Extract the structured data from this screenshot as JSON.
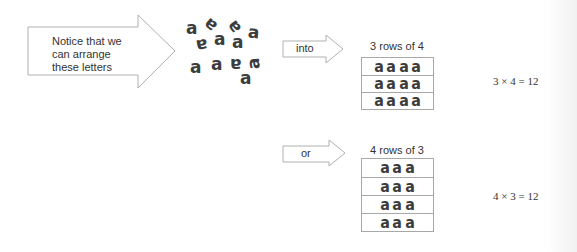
{
  "intro_arrow": {
    "lines": [
      "Notice that we",
      "can arrange",
      "these letters"
    ]
  },
  "scattered_letters": [
    {
      "char": "a",
      "x": 186,
      "y": 20,
      "rot": 0
    },
    {
      "char": "a",
      "x": 205,
      "y": 15,
      "rot": -140
    },
    {
      "char": "a",
      "x": 229,
      "y": 17,
      "rot": -125
    },
    {
      "char": "a",
      "x": 248,
      "y": 24,
      "rot": 5
    },
    {
      "char": "a",
      "x": 196,
      "y": 35,
      "rot": 170
    },
    {
      "char": "a",
      "x": 214,
      "y": 31,
      "rot": 0
    },
    {
      "char": "a",
      "x": 232,
      "y": 34,
      "rot": 0
    },
    {
      "char": "a",
      "x": 190,
      "y": 59,
      "rot": 0
    },
    {
      "char": "a",
      "x": 211,
      "y": 56,
      "rot": 0
    },
    {
      "char": "a",
      "x": 230,
      "y": 54,
      "rot": 180
    },
    {
      "char": "a",
      "x": 249,
      "y": 54,
      "rot": -95
    },
    {
      "char": "a",
      "x": 240,
      "y": 70,
      "rot": 0
    }
  ],
  "arrangements": [
    {
      "connector": "into",
      "title": "3 rows of 4",
      "rows": [
        [
          "a",
          "a",
          "a",
          "a"
        ],
        [
          "a",
          "a",
          "a",
          "a"
        ],
        [
          "a",
          "a",
          "a",
          "a"
        ]
      ],
      "equation": "3 × 4 = 12"
    },
    {
      "connector": "or",
      "title": "4 rows of 3",
      "rows": [
        [
          "a",
          "a",
          "a"
        ],
        [
          "a",
          "a",
          "a"
        ],
        [
          "a",
          "a",
          "a"
        ],
        [
          "a",
          "a",
          "a"
        ]
      ],
      "equation": "4 × 3 = 12"
    }
  ],
  "colors": {
    "outline": "#a8a8a8",
    "letter": "#3c3c3c",
    "text": "#333333"
  }
}
